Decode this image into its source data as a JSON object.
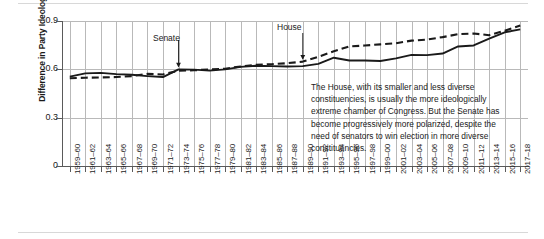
{
  "chart_data": {
    "type": "line",
    "title": "",
    "xlabel": "",
    "ylabel": "Difference in Party Ideology",
    "ylim": [
      0,
      0.9
    ],
    "yticks": [
      "0",
      "0.3",
      "0.6",
      "0.9"
    ],
    "ytick_values": [
      0,
      0.3,
      0.6,
      0.9
    ],
    "grid": "both",
    "legend": "inline-annotations",
    "categories": [
      "1959–60",
      "1961–62",
      "1963–64",
      "1965–66",
      "1967–68",
      "1969–70",
      "1971–72",
      "1973–74",
      "1975–76",
      "1977–78",
      "1979–80",
      "1981–82",
      "1983–84",
      "1985–86",
      "1987–88",
      "1989–90",
      "1991–92",
      "1993–94",
      "1995–96",
      "1997–98",
      "1999–00",
      "2001–02",
      "2003–04",
      "2005–06",
      "2007–08",
      "2009–10",
      "2011–12",
      "2013–14",
      "2015–16",
      "2017–18"
    ],
    "series": [
      {
        "name": "Senate",
        "style": "solid",
        "color": "#1a1a1a",
        "values": [
          0.555,
          0.575,
          0.578,
          0.57,
          0.566,
          0.558,
          0.552,
          0.6,
          0.598,
          0.592,
          0.6,
          0.615,
          0.622,
          0.62,
          0.618,
          0.62,
          0.634,
          0.672,
          0.655,
          0.655,
          0.652,
          0.668,
          0.69,
          0.688,
          0.698,
          0.742,
          0.748,
          0.79,
          0.83,
          0.848
        ]
      },
      {
        "name": "House",
        "style": "dashed",
        "color": "#1a1a1a",
        "values": [
          0.545,
          0.548,
          0.55,
          0.552,
          0.558,
          0.572,
          0.568,
          0.592,
          0.594,
          0.6,
          0.604,
          0.618,
          0.628,
          0.632,
          0.638,
          0.648,
          0.678,
          0.712,
          0.742,
          0.748,
          0.755,
          0.762,
          0.778,
          0.785,
          0.8,
          0.818,
          0.822,
          0.812,
          0.84,
          0.872
        ]
      }
    ],
    "annotations": [
      {
        "text": "Senate",
        "points_to_series": "Senate",
        "points_to_category": "1973–74"
      },
      {
        "text": "House",
        "points_to_series": "House",
        "points_to_category": "1989–90"
      }
    ],
    "callout": "The House, with its smaller and less diverse constituencies, is usually the more ideologically extreme chamber of Congress. But the Senate has become progressively more polarized, despite the need of senators to win election in more diverse constituencies."
  }
}
